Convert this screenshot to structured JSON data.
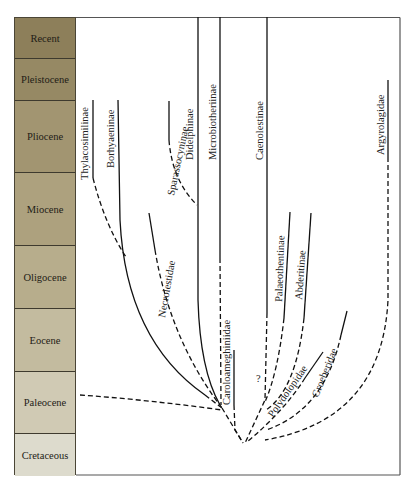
{
  "figure": {
    "type": "phylogeny-over-geologic-time",
    "timescale": {
      "epochs": [
        {
          "name": "Recent",
          "top": 0,
          "height": 41,
          "color": "#8d7f5a"
        },
        {
          "name": "Pleistocene",
          "top": 41,
          "height": 42,
          "color": "#968964"
        },
        {
          "name": "Pliocene",
          "top": 83,
          "height": 72,
          "color": "#a29571"
        },
        {
          "name": "Miocene",
          "top": 155,
          "height": 73,
          "color": "#ada17e"
        },
        {
          "name": "Oligocene",
          "top": 228,
          "height": 63,
          "color": "#b7ad8c"
        },
        {
          "name": "Eocene",
          "top": 291,
          "height": 63,
          "color": "#c3bb9f"
        },
        {
          "name": "Paleocene",
          "top": 354,
          "height": 62,
          "color": "#d0cab4"
        },
        {
          "name": "Cretaceous",
          "top": 416,
          "height": 42,
          "color": "#dddbcd"
        }
      ]
    },
    "taxa": [
      {
        "name": "Thylacosimilinae"
      },
      {
        "name": "Borhyaeninae"
      },
      {
        "name": "Sparassocyninae"
      },
      {
        "name": "Didelphinae"
      },
      {
        "name": "Microbiotheriinae"
      },
      {
        "name": "Caenolestinae"
      },
      {
        "name": "Argyrolagidae"
      },
      {
        "name": "Necrolestidae"
      },
      {
        "name": "Palaeothentinae"
      },
      {
        "name": "Abderitinae"
      },
      {
        "name": "Caroloameghiniidae"
      },
      {
        "name": "Polydolopidae"
      },
      {
        "name": "Groeberidae"
      }
    ],
    "uncertain_marker": "?",
    "line_styles": {
      "known": "solid",
      "inferred": "dashed"
    }
  }
}
